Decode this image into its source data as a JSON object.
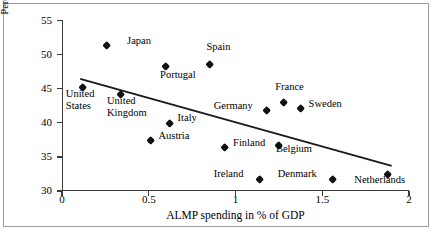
{
  "chart_data": {
    "type": "scatter",
    "title": "",
    "xlabel": "ALMP spending in % of GDP",
    "ylabel": "Percentage of workers feeling insecure about their jobs",
    "ylabel_line1": "Percentage of workers feeling insecure",
    "ylabel_line2": "about their jobs",
    "xlim": [
      0,
      2
    ],
    "ylim": [
      30,
      55
    ],
    "xticks": [
      "0",
      "0.5",
      "1",
      "1.5",
      "2"
    ],
    "xtick_values": [
      0,
      0.5,
      1,
      1.5,
      2
    ],
    "yticks": [
      "30",
      "35",
      "40",
      "45",
      "50",
      "55"
    ],
    "ytick_values": [
      30,
      35,
      40,
      45,
      50,
      55
    ],
    "grid": false,
    "legend": "none",
    "marker": "diamond",
    "marker_color": "#111111",
    "trendline": {
      "type": "linear",
      "color": "#1a1a1a",
      "x_start": 0.105,
      "y_start": 46.45,
      "x_end": 1.9,
      "y_end": 33.7
    },
    "points": [
      {
        "label": "Japan",
        "x": 0.26,
        "y": 51.4,
        "lx": 20,
        "ly": -4
      },
      {
        "label": "Spain",
        "x": 0.85,
        "y": 48.5,
        "lx": -3,
        "ly": -18
      },
      {
        "label": "Portugal",
        "x": 0.6,
        "y": 48.2,
        "lx": -6,
        "ly": 8
      },
      {
        "label": "United\nStates",
        "x": 0.12,
        "y": 45.2,
        "lx": -17,
        "ly": 7,
        "line1": "United",
        "line2": "States"
      },
      {
        "label": "United\nKingdom",
        "x": 0.34,
        "y": 44.2,
        "lx": -14,
        "ly": 7,
        "line1": "United",
        "line2": "Kingdom"
      },
      {
        "label": "France",
        "x": 1.275,
        "y": 42.9,
        "lx": -8,
        "ly": -16
      },
      {
        "label": "Sweden",
        "x": 1.375,
        "y": 42.1,
        "lx": 8,
        "ly": -5
      },
      {
        "label": "Germany",
        "x": 1.18,
        "y": 41.8,
        "lx": -53,
        "ly": -5
      },
      {
        "label": "Italy",
        "x": 0.62,
        "y": 39.95,
        "lx": 8,
        "ly": -5
      },
      {
        "label": "Austria",
        "x": 0.51,
        "y": 37.4,
        "lx": 8,
        "ly": -5
      },
      {
        "label": "Belgium",
        "x": 1.25,
        "y": 36.6,
        "lx": -3,
        "ly": 3
      },
      {
        "label": "Finland",
        "x": 0.94,
        "y": 36.3,
        "lx": 8,
        "ly": -5
      },
      {
        "label": "Denmark",
        "x": 1.56,
        "y": 31.7,
        "lx": -55,
        "ly": -5
      },
      {
        "label": "Ireland",
        "x": 1.14,
        "y": 31.7,
        "lx": -46,
        "ly": -5
      },
      {
        "label": "Netherlands",
        "x": 1.875,
        "y": 32.35,
        "lx": -33,
        "ly": 5
      }
    ]
  }
}
